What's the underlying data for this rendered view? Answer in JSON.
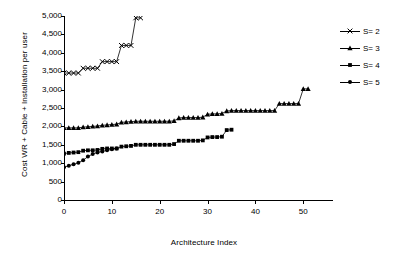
{
  "chart_data": {
    "type": "line",
    "title": "",
    "xlabel": "Architecture Index",
    "ylabel": "Cost WR + Cable + Installation per user",
    "xlim": [
      0,
      56
    ],
    "ylim": [
      0,
      5000
    ],
    "xticks": [
      0,
      10,
      20,
      30,
      40,
      50
    ],
    "xtick_labels": [
      "0",
      "10",
      "20",
      "30",
      "40",
      "50"
    ],
    "yticks": [
      0,
      500,
      1000,
      1500,
      2000,
      2500,
      3000,
      3500,
      4000,
      4500,
      5000
    ],
    "ytick_labels": [
      "0",
      "500",
      "1,000",
      "1,500",
      "2,000",
      "2,500",
      "3,000",
      "3,500",
      "4,000",
      "4,500",
      "5,000"
    ],
    "grid": false,
    "legend_position": "top-right",
    "series": [
      {
        "name": "S= 2",
        "marker": "x-cross",
        "color": "#000000",
        "x": [
          0,
          1,
          2,
          3,
          4,
          5,
          6,
          7,
          8,
          9,
          10,
          11,
          12,
          13,
          14,
          15,
          16
        ],
        "values": [
          3450,
          3450,
          3450,
          3450,
          3580,
          3580,
          3580,
          3580,
          3760,
          3760,
          3760,
          3760,
          4200,
          4200,
          4200,
          4950,
          4950
        ]
      },
      {
        "name": "S= 3",
        "marker": "triangle",
        "color": "#000000",
        "x": [
          0,
          1,
          2,
          3,
          4,
          5,
          6,
          7,
          8,
          9,
          10,
          11,
          12,
          13,
          14,
          15,
          16,
          17,
          18,
          19,
          20,
          21,
          22,
          23,
          24,
          25,
          26,
          27,
          28,
          29,
          30,
          31,
          32,
          33,
          34,
          35,
          36,
          37,
          38,
          39,
          40,
          41,
          42,
          43,
          44,
          45,
          46,
          47,
          48,
          49,
          50,
          51
        ],
        "values": [
          1960,
          1960,
          1960,
          1960,
          1980,
          1990,
          2000,
          2010,
          2030,
          2040,
          2050,
          2060,
          2110,
          2120,
          2130,
          2140,
          2140,
          2140,
          2140,
          2140,
          2140,
          2140,
          2140,
          2150,
          2230,
          2240,
          2240,
          2240,
          2240,
          2250,
          2330,
          2340,
          2340,
          2350,
          2420,
          2430,
          2430,
          2430,
          2430,
          2430,
          2430,
          2430,
          2430,
          2430,
          2430,
          2620,
          2620,
          2620,
          2620,
          2620,
          3020,
          3020
        ]
      },
      {
        "name": "S= 4",
        "marker": "square",
        "color": "#000000",
        "x": [
          0,
          1,
          2,
          3,
          4,
          5,
          6,
          7,
          8,
          9,
          10,
          11,
          12,
          13,
          14,
          15,
          16,
          17,
          18,
          19,
          20,
          21,
          22,
          23,
          24,
          25,
          26,
          27,
          28,
          29,
          30,
          31,
          32,
          33,
          34,
          35
        ],
        "values": [
          1260,
          1280,
          1290,
          1300,
          1340,
          1350,
          1350,
          1360,
          1390,
          1400,
          1400,
          1400,
          1450,
          1460,
          1470,
          1500,
          1500,
          1500,
          1500,
          1500,
          1500,
          1500,
          1500,
          1520,
          1610,
          1610,
          1610,
          1610,
          1610,
          1620,
          1700,
          1710,
          1710,
          1720,
          1900,
          1910
        ]
      },
      {
        "name": "S= 5",
        "marker": "circle",
        "color": "#000000",
        "x": [
          0,
          1,
          2,
          3,
          4,
          5,
          6,
          7,
          8,
          9,
          10,
          11
        ],
        "values": [
          890,
          930,
          970,
          1010,
          1080,
          1180,
          1250,
          1290,
          1320,
          1350,
          1380,
          1400
        ]
      }
    ]
  },
  "legend": {
    "items": [
      {
        "label": "S= 2",
        "marker": "x-cross"
      },
      {
        "label": "S= 3",
        "marker": "triangle"
      },
      {
        "label": "S= 4",
        "marker": "square"
      },
      {
        "label": "S= 5",
        "marker": "circle"
      }
    ]
  }
}
